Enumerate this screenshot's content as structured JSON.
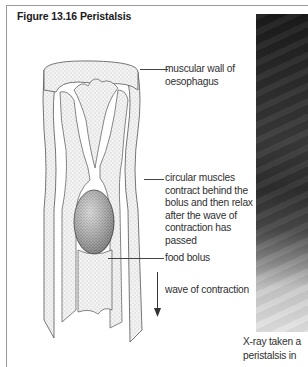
{
  "figure": {
    "title": "Figure 13.16  Peristalsis"
  },
  "labels": {
    "muscular_wall": [
      "muscular wall of",
      "oesophagus"
    ],
    "circular_muscles": [
      "circular muscles",
      "contract behind the",
      "bolus and then relax",
      "after the wave of",
      "contraction has",
      "passed"
    ],
    "food_bolus": "food bolus",
    "wave": "wave of contraction"
  },
  "xray": {
    "caption_line1": "X-ray taken a",
    "caption_line2": "peristalsis in"
  },
  "colors": {
    "frame": "#9a9a9a",
    "text": "#2f2f2f",
    "stipple": "#6a6a6a"
  }
}
